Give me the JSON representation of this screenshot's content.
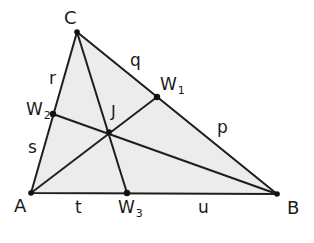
{
  "diagram": {
    "type": "triangle-cevians",
    "colors": {
      "fill": "#ececec",
      "stroke": "#1e1e1e",
      "text": "#1a1a1a",
      "background": "#ffffff"
    },
    "vertices": [
      {
        "id": "A",
        "label": "A",
        "x": 31,
        "y": 193
      },
      {
        "id": "B",
        "label": "B",
        "x": 277,
        "y": 194
      },
      {
        "id": "C",
        "label": "C",
        "x": 77,
        "y": 32
      }
    ],
    "cevian_feet": [
      {
        "id": "W1",
        "label": "W",
        "sub": "1",
        "x": 157,
        "y": 97,
        "on_side": "BC"
      },
      {
        "id": "W2",
        "label": "W",
        "sub": "2",
        "x": 53,
        "y": 114,
        "on_side": "AC"
      },
      {
        "id": "W3",
        "label": "W",
        "sub": "3",
        "x": 127,
        "y": 193,
        "on_side": "AB"
      }
    ],
    "concurrency_point": {
      "id": "J",
      "label": "J",
      "x": 109,
      "y": 132
    },
    "cevians": [
      {
        "from": "A",
        "to": "W1"
      },
      {
        "from": "B",
        "to": "W2"
      },
      {
        "from": "C",
        "to": "W3"
      }
    ],
    "segment_labels": [
      {
        "label": "q",
        "segment": "C-W1"
      },
      {
        "label": "p",
        "segment": "W1-B"
      },
      {
        "label": "r",
        "segment": "C-W2"
      },
      {
        "label": "s",
        "segment": "W2-A"
      },
      {
        "label": "t",
        "segment": "A-W3"
      },
      {
        "label": "u",
        "segment": "W3-B"
      }
    ]
  },
  "labels": {
    "A": "A",
    "B": "B",
    "C": "C",
    "J": "J",
    "W1": "W",
    "W1_sub": "1",
    "W2": "W",
    "W2_sub": "2",
    "W3": "W",
    "W3_sub": "3",
    "p": "p",
    "q": "q",
    "r": "r",
    "s": "s",
    "t": "t",
    "u": "u"
  }
}
